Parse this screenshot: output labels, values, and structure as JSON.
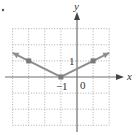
{
  "chart_data": {
    "type": "line",
    "title": "",
    "function": "y = 1/2 |x + 1|",
    "xlabel": "x",
    "ylabel": "y",
    "xlim": [
      -4,
      2
    ],
    "ylim": [
      -3,
      3
    ],
    "grid": true,
    "grid_style": "dotted",
    "tick_labels": [
      {
        "text": "1",
        "axis": "y",
        "value": 1
      },
      {
        "text": "−1",
        "axis": "x",
        "value": -1
      },
      {
        "text": "0",
        "axis": "origin",
        "value": 0
      }
    ],
    "series": [
      {
        "name": "graph",
        "points": [
          [
            -4,
            1.5
          ],
          [
            -1,
            0
          ],
          [
            2,
            1.5
          ]
        ],
        "arrows_at_ends": true,
        "color": "#8e8e8e"
      }
    ],
    "marked_points": [
      [
        -3,
        1
      ],
      [
        -1,
        0
      ],
      [
        1,
        1
      ]
    ]
  }
}
